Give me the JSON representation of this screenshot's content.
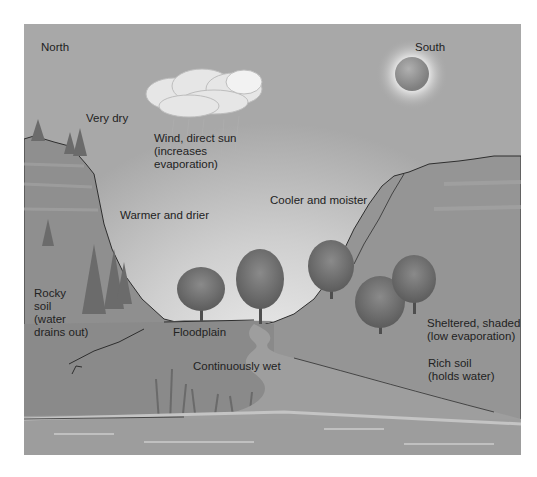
{
  "diagram": {
    "type": "illustration",
    "labels": {
      "north": "North",
      "south": "South",
      "very_dry": "Very dry",
      "wind_sun": "Wind, direct sun\n(increases\nevaporation)",
      "warmer_drier": "Warmer and drier",
      "cooler_moister": "Cooler and moister",
      "rocky_soil": "Rocky\nsoil\n(water\ndrains out)",
      "floodplain": "Floodplain",
      "continuously_wet": "Continuously wet",
      "sheltered": "Sheltered, shaded\n(low evaporation)",
      "rich_soil": "Rich soil\n(holds water)"
    },
    "colors": {
      "sky": "#a8a8a8",
      "sky_light": "#e2e2e2",
      "slope": "#8c8c8c",
      "slope_dark": "#7a7a7a",
      "water": "#9a9a9a",
      "tree": "#6f6f6f",
      "sun": "#8f8f8f",
      "outline": "#333333"
    }
  }
}
